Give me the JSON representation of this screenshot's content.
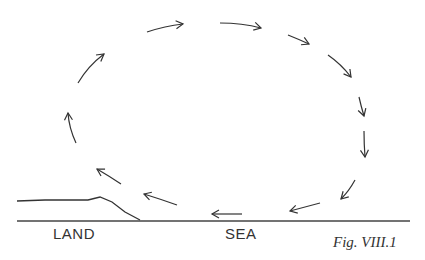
{
  "figure": {
    "caption": "Fig. VIII.1"
  },
  "labels": {
    "land": "LAND",
    "sea": "SEA"
  },
  "colors": {
    "ink": "#333333",
    "background": "#ffffff"
  },
  "circulation_arrows": [
    {
      "id": 1,
      "from": [
        78,
        83
      ],
      "to": [
        104,
        54
      ],
      "curve": [
        88,
        66
      ]
    },
    {
      "id": 2,
      "from": [
        147,
        32
      ],
      "to": [
        183,
        24
      ],
      "curve": [
        165,
        26
      ]
    },
    {
      "id": 3,
      "from": [
        220,
        23
      ],
      "to": [
        261,
        28
      ],
      "curve": [
        242,
        23
      ]
    },
    {
      "id": 4,
      "from": [
        288,
        35
      ],
      "to": [
        309,
        44
      ],
      "curve": [
        298,
        39
      ]
    },
    {
      "id": 5,
      "from": [
        328,
        55
      ],
      "to": [
        351,
        77
      ],
      "curve": [
        341,
        64
      ]
    },
    {
      "id": 6,
      "from": [
        359,
        97
      ],
      "to": [
        364,
        116
      ],
      "curve": [
        361,
        106
      ]
    },
    {
      "id": 7,
      "from": [
        364,
        131
      ],
      "to": [
        365,
        157
      ],
      "curve": [
        364,
        144
      ]
    },
    {
      "id": 8,
      "from": [
        355,
        180
      ],
      "to": [
        341,
        199
      ],
      "curve": [
        349,
        191
      ]
    },
    {
      "id": 9,
      "from": [
        320,
        203
      ],
      "to": [
        290,
        211
      ],
      "curve": [
        305,
        207
      ]
    },
    {
      "id": 10,
      "from": [
        242,
        214
      ],
      "to": [
        212,
        214
      ],
      "curve": [
        227,
        214
      ]
    },
    {
      "id": 11,
      "from": [
        177,
        205
      ],
      "to": [
        144,
        194
      ],
      "curve": [
        160,
        199
      ]
    },
    {
      "id": 12,
      "from": [
        121,
        184
      ],
      "to": [
        97,
        169
      ],
      "curve": [
        109,
        176
      ]
    },
    {
      "id": 13,
      "from": [
        76,
        143
      ],
      "to": [
        68,
        113
      ],
      "curve": [
        69,
        128
      ]
    }
  ],
  "ground": {
    "baseline": {
      "x1": 17,
      "x2": 410,
      "y": 221
    },
    "land_profile": [
      [
        17,
        201
      ],
      [
        45,
        200
      ],
      [
        70,
        200
      ],
      [
        88,
        200
      ],
      [
        100,
        197
      ],
      [
        112,
        202
      ],
      [
        125,
        212
      ],
      [
        140,
        220
      ]
    ]
  }
}
